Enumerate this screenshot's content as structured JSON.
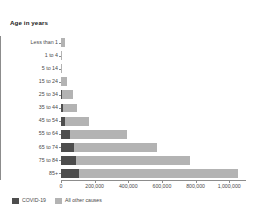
{
  "chart_data": {
    "type": "bar",
    "subtype": "horizontal-stacked-bar",
    "title": "Age in years",
    "xlabel": "",
    "ylabel": "Age in years",
    "categories": [
      "Less than 1",
      "1 to 4",
      "5 to 14",
      "15 to 24",
      "25 to 34",
      "35 to 44",
      "45 to 54",
      "55 to 64",
      "65 to 74",
      "75 to 84",
      "85+"
    ],
    "series": [
      {
        "name": "COVID-19",
        "color": "#4d4d4d",
        "values": [
          0,
          0,
          0,
          1000,
          4000,
          9000,
          24000,
          55000,
          78000,
          90000,
          107000
        ]
      },
      {
        "name": "All other causes",
        "color": "#b3b3b3",
        "values": [
          21000,
          4000,
          6000,
          35000,
          65000,
          85000,
          140000,
          340000,
          490000,
          680000,
          945000
        ]
      }
    ],
    "xlim": [
      0,
      1100000
    ],
    "xticks": [
      0,
      200000,
      400000,
      600000,
      800000,
      1000000
    ],
    "xtick_labels": [
      "0",
      "200,000",
      "400,000",
      "600,000",
      "800,000",
      "1,000,000"
    ],
    "grid": false,
    "legend_position": "bottom-left",
    "stacked": true,
    "orientation": "horizontal"
  },
  "legend": {
    "items": [
      {
        "label": "COVID-19",
        "color": "#4d4d4d"
      },
      {
        "label": "All other causes",
        "color": "#b3b3b3"
      }
    ]
  },
  "colors": {
    "covid": "#4d4d4d",
    "other": "#b3b3b3",
    "axis": "#8c8c8c",
    "text": "#4a4a4a",
    "title": "#1a1a1a",
    "background": "#ffffff"
  }
}
